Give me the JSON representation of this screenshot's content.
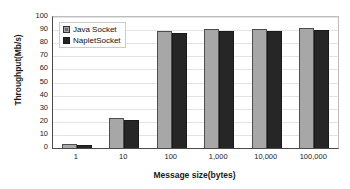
{
  "chart_data": {
    "type": "bar",
    "title": "",
    "xlabel": "Message size(bytes)",
    "ylabel": "Throughput(Mb/s)",
    "categories": [
      "1",
      "10",
      "100",
      "1,000",
      "10,000",
      "100,000"
    ],
    "series": [
      {
        "name": "Java Socket",
        "color": "#a7a7a7",
        "values": [
          3,
          23,
          89.5,
          91,
          91,
          91.5
        ]
      },
      {
        "name": "NapletSocket",
        "color": "#262626",
        "values": [
          2.5,
          21.5,
          87.5,
          89,
          89,
          90
        ]
      }
    ],
    "ylim": [
      0,
      100
    ],
    "yticks": [
      100,
      90,
      80,
      70,
      60,
      50,
      40,
      30,
      20,
      10,
      0
    ],
    "grid": true,
    "legend_position": "top-left"
  }
}
